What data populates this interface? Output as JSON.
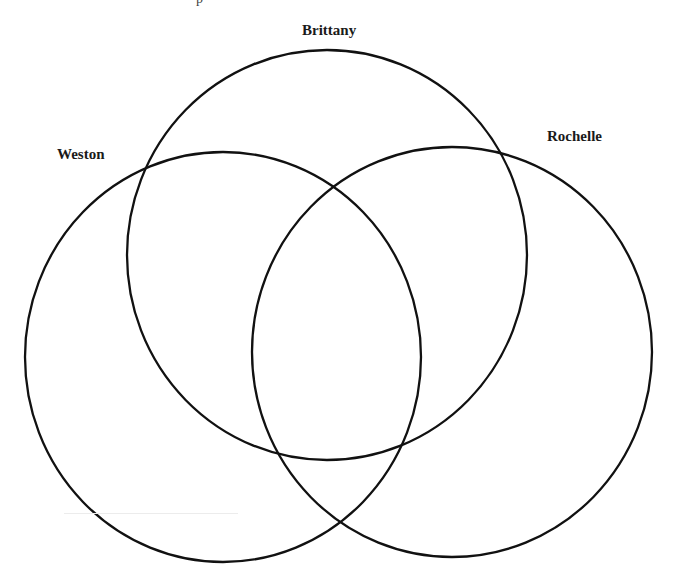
{
  "diagram": {
    "type": "venn",
    "sets": [
      {
        "name": "Brittany",
        "label_pos": [
          302,
          22
        ],
        "circle": {
          "cx": 327,
          "cy": 255,
          "rx": 200,
          "ry": 205
        }
      },
      {
        "name": "Weston",
        "label_pos": [
          57,
          146
        ],
        "circle": {
          "cx": 223,
          "cy": 357,
          "rx": 198,
          "ry": 205
        }
      },
      {
        "name": "Rochelle",
        "label_pos": [
          547,
          128
        ],
        "circle": {
          "cx": 452,
          "cy": 352,
          "rx": 200,
          "ry": 205
        }
      }
    ],
    "stroke_color": "#111111",
    "stroke_width": 2.3,
    "top_fragment": "p"
  }
}
